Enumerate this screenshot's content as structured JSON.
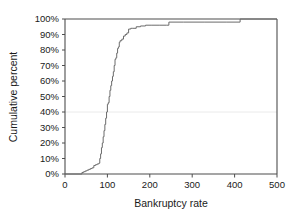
{
  "chart_data": {
    "type": "line",
    "subtype": "step-ecdf",
    "title": "",
    "xlabel": "Bankruptcy rate",
    "ylabel": "Cumulative percent",
    "xlim": [
      0,
      500
    ],
    "ylim": [
      0,
      100
    ],
    "xticks": [
      0,
      100,
      200,
      300,
      400,
      500
    ],
    "xticklabels": [
      "0",
      "100",
      "200",
      "300",
      "400",
      "500"
    ],
    "yticks": [
      0,
      10,
      20,
      30,
      40,
      50,
      60,
      70,
      80,
      90,
      100
    ],
    "yticklabels": [
      "0%",
      "10%",
      "20%",
      "30%",
      "40%",
      "50%",
      "60%",
      "70%",
      "80%",
      "90%",
      "100%"
    ],
    "grid": "single faint horizontal line at 40%",
    "gridline_values": [
      40
    ],
    "legend": "none",
    "series": [
      {
        "name": "Cumulative percent of bankruptcy rate",
        "color": "#6b6b6b",
        "x": [
          0,
          38,
          40,
          44,
          48,
          52,
          56,
          60,
          64,
          68,
          72,
          76,
          80,
          82,
          84,
          86,
          88,
          90,
          92,
          94,
          96,
          98,
          100,
          102,
          104,
          106,
          108,
          110,
          112,
          114,
          116,
          118,
          120,
          122,
          124,
          126,
          128,
          130,
          134,
          138,
          142,
          146,
          150,
          155,
          160,
          168,
          178,
          190,
          205,
          222,
          240,
          245,
          280,
          330,
          380,
          413,
          500
        ],
        "y": [
          0,
          0,
          1,
          1.5,
          2,
          2.5,
          3,
          3.5,
          4,
          5.5,
          6,
          6.5,
          7,
          10,
          13,
          17,
          20,
          24,
          28,
          32,
          36,
          40,
          45,
          46,
          50,
          54,
          57,
          60,
          63,
          66,
          70,
          74,
          75,
          78,
          81,
          82,
          85,
          86,
          87,
          89,
          90,
          91,
          93.5,
          94,
          94,
          95,
          95.5,
          96,
          96,
          96,
          96,
          98,
          98,
          98,
          98,
          100,
          100
        ]
      }
    ]
  },
  "axes": {
    "x_title": "Bankruptcy rate",
    "y_title": "Cumulative percent"
  }
}
